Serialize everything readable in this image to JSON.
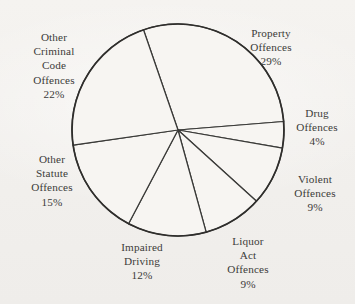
{
  "chart_data": {
    "type": "pie",
    "title": "",
    "subtitle": "",
    "xlabel": "",
    "ylabel": "",
    "legend_position": "none",
    "grid": false,
    "labels_show_percent": true,
    "categories": [
      "Property Offences",
      "Drug Offences",
      "Violent Offences",
      "Liquor Act Offences",
      "Impaired Driving",
      "Other Statute Offences",
      "Other Criminal Code Offences"
    ],
    "values": [
      29,
      4,
      9,
      9,
      12,
      15,
      22
    ],
    "units": "percent",
    "slices": [
      {
        "name": "Property Offences",
        "value": 29,
        "percent_text": "29%",
        "label_lines": [
          "Property",
          "Offences"
        ],
        "start_angle_deg": 341,
        "end_angle_deg": 445.4
      },
      {
        "name": "Drug Offences",
        "value": 4,
        "percent_text": "4%",
        "label_lines": [
          "Drug",
          "Offences"
        ],
        "start_angle_deg": 445.4,
        "end_angle_deg": 459.8
      },
      {
        "name": "Violent Offences",
        "value": 9,
        "percent_text": "9%",
        "label_lines": [
          "Violent",
          "Offences"
        ],
        "start_angle_deg": 459.8,
        "end_angle_deg": 492.2
      },
      {
        "name": "Liquor Act Offences",
        "value": 9,
        "percent_text": "9%",
        "label_lines": [
          "Liquor",
          "Act",
          "Offences"
        ],
        "start_angle_deg": 492.2,
        "end_angle_deg": 524.6
      },
      {
        "name": "Impaired Driving",
        "value": 12,
        "percent_text": "12%",
        "label_lines": [
          "Impaired",
          "Driving"
        ],
        "start_angle_deg": 524.6,
        "end_angle_deg": 567.8
      },
      {
        "name": "Other Statute Offences",
        "value": 15,
        "percent_text": "15%",
        "label_lines": [
          "Other",
          "Statute",
          "Offences"
        ],
        "start_angle_deg": 567.8,
        "end_angle_deg": 621.8
      },
      {
        "name": "Other Criminal Code Offences",
        "value": 22,
        "percent_text": "22%",
        "label_lines": [
          "Other",
          "Criminal",
          "Code",
          "Offences"
        ],
        "start_angle_deg": 621.8,
        "end_angle_deg": 701.0
      }
    ]
  },
  "labels": {
    "property": {
      "l1": "Property",
      "l2": "Offences",
      "pct": "29%"
    },
    "drug": {
      "l1": "Drug",
      "l2": "Offences",
      "pct": "4%"
    },
    "violent": {
      "l1": "Violent",
      "l2": "Offences",
      "pct": "9%"
    },
    "liquor": {
      "l1": "Liquor",
      "l2": "Act",
      "l3": "Offences",
      "pct": "9%"
    },
    "impaired": {
      "l1": "Impaired",
      "l2": "Driving",
      "pct": "12%"
    },
    "statute": {
      "l1": "Other",
      "l2": "Statute",
      "l3": "Offences",
      "pct": "15%"
    },
    "criminal": {
      "l1": "Other",
      "l2": "Criminal",
      "l3": "Code",
      "l4": "Offences",
      "pct": "22%"
    }
  },
  "style": {
    "background_color": "#f3f1ee",
    "ink_color": "#3a3a38",
    "slice_fill": "#f7f5f2"
  }
}
